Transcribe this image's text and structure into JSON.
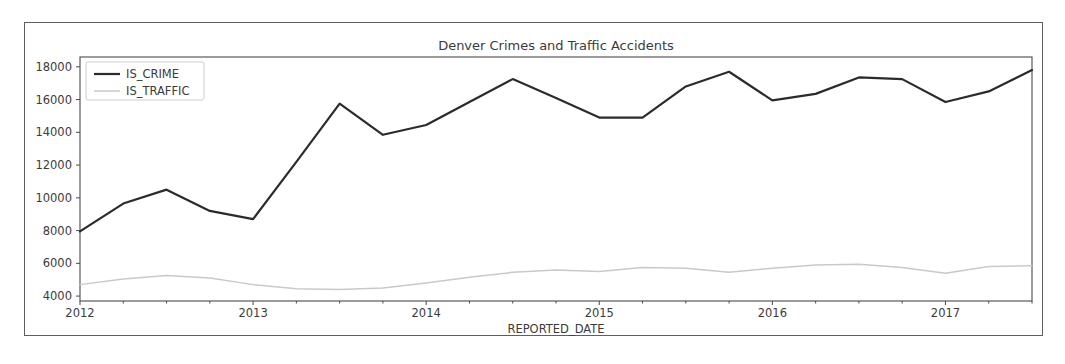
{
  "figure": {
    "title": "Denver Crimes and Traffic Accidents",
    "xlabel": "REPORTED_DATE"
  },
  "legend": {
    "entries": [
      {
        "label": "IS_CRIME",
        "color": "#2b2b2b"
      },
      {
        "label": "IS_TRAFFIC",
        "color": "#c9c9c9"
      }
    ]
  },
  "axes": {
    "y_ticks": [
      "4000",
      "6000",
      "8000",
      "10000",
      "12000",
      "14000",
      "16000",
      "18000"
    ],
    "x_ticks": [
      "2012",
      "2013",
      "2014",
      "2015",
      "2016",
      "2017"
    ]
  },
  "chart_data": {
    "type": "line",
    "title": "Denver Crimes and Traffic Accidents",
    "xlabel": "REPORTED_DATE",
    "ylabel": "",
    "xlim": [
      2012.0,
      2017.5
    ],
    "ylim": [
      3700,
      18600
    ],
    "grid": false,
    "legend_position": "upper left",
    "x_tick_values": [
      2012,
      2013,
      2014,
      2015,
      2016,
      2017
    ],
    "x_tick_labels": [
      "2012",
      "2013",
      "2014",
      "2015",
      "2016",
      "2017"
    ],
    "y_tick_values": [
      4000,
      6000,
      8000,
      10000,
      12000,
      14000,
      16000,
      18000
    ],
    "y_tick_labels": [
      "4000",
      "6000",
      "8000",
      "10000",
      "12000",
      "14000",
      "16000",
      "18000"
    ],
    "x": [
      2012.0,
      2012.25,
      2012.5,
      2012.75,
      2013.0,
      2013.25,
      2013.5,
      2013.75,
      2014.0,
      2014.25,
      2014.5,
      2014.75,
      2015.0,
      2015.25,
      2015.5,
      2015.75,
      2016.0,
      2016.25,
      2016.5,
      2016.75,
      2017.0,
      2017.25,
      2017.5
    ],
    "x_labels": [
      "2012-Q1",
      "2012-Q2",
      "2012-Q3",
      "2012-Q4",
      "2013-Q1",
      "2013-Q2",
      "2013-Q3",
      "2013-Q4",
      "2014-Q1",
      "2014-Q2",
      "2014-Q3",
      "2014-Q4",
      "2015-Q1",
      "2015-Q2",
      "2015-Q3",
      "2015-Q4",
      "2016-Q1",
      "2016-Q2",
      "2016-Q3",
      "2016-Q4",
      "2017-Q1",
      "2017-Q2",
      "2017-Q3"
    ],
    "series": [
      {
        "name": "IS_CRIME",
        "color": "#2b2b2b",
        "values": [
          7950,
          9650,
          10500,
          9200,
          8700,
          12200,
          15750,
          13850,
          14450,
          15850,
          17250,
          16100,
          14900,
          14900,
          16800,
          17700,
          15950,
          16350,
          17350,
          17250,
          15850,
          16500,
          17800
        ]
      },
      {
        "name": "IS_TRAFFIC",
        "color": "#c9c9c9",
        "values": [
          4700,
          5050,
          5250,
          5100,
          4700,
          4450,
          4400,
          4500,
          4800,
          5150,
          5450,
          5600,
          5500,
          5750,
          5700,
          5450,
          5700,
          5900,
          5950,
          5750,
          5400,
          5800,
          5850
        ]
      }
    ]
  }
}
